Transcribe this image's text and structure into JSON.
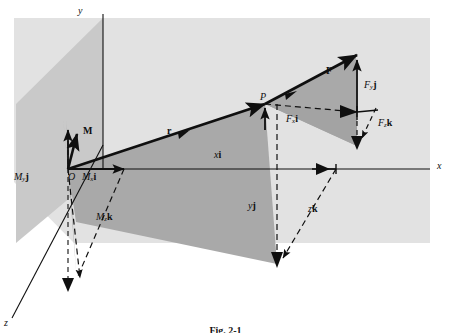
{
  "figure": {
    "caption": "Fig. 2-1",
    "background_color": "#ffffff",
    "panel_color": "#e2e2e2",
    "plane_shade_color": "#b9b9b9",
    "line_color": "#0f0f0f"
  },
  "axes": [
    {
      "name": "y-axis",
      "label": "y",
      "x": 78,
      "y": 6
    },
    {
      "name": "x-axis",
      "label": "x",
      "x": 437,
      "y": 167
    },
    {
      "name": "z-axis",
      "label": "z",
      "x": 4,
      "y": 320
    }
  ],
  "points": [
    {
      "name": "origin",
      "label": "O",
      "x": 68,
      "y": 177
    },
    {
      "name": "point-p",
      "label": "P",
      "x": 265,
      "y": 101
    }
  ],
  "vectors": [
    {
      "name": "force-vector",
      "label": "F",
      "x": 326,
      "y": 65
    },
    {
      "name": "position-vector",
      "label": "r",
      "x": 165,
      "y": 119
    },
    {
      "name": "moment-vector",
      "label": "M",
      "x": 82,
      "y": 120
    }
  ],
  "components": [
    {
      "name": "force-x-component",
      "base": "F",
      "sub": "x",
      "unit": "i",
      "x": 288,
      "y": 113
    },
    {
      "name": "force-y-component",
      "base": "F",
      "sub": "y",
      "unit": "j",
      "x": 365,
      "y": 85
    },
    {
      "name": "force-z-component",
      "base": "F",
      "sub": "z",
      "unit": "k",
      "x": 378,
      "y": 122
    },
    {
      "name": "moment-x-component",
      "base": "M",
      "sub": "x",
      "unit": "i",
      "x": 84,
      "y": 176
    },
    {
      "name": "moment-y-component",
      "base": "M",
      "sub": "y",
      "unit": "j",
      "x": 15,
      "y": 176
    },
    {
      "name": "moment-z-component",
      "base": "M",
      "sub": "z",
      "unit": "k",
      "x": 97,
      "y": 216
    },
    {
      "name": "position-x-component",
      "base": "",
      "sub": "",
      "unit": "",
      "x": 0,
      "y": 0
    }
  ],
  "position_components": [
    {
      "name": "position-x-component",
      "label_italic": "x",
      "label_bold": "i",
      "x": 216,
      "y": 154
    },
    {
      "name": "position-y-component",
      "label_italic": "y",
      "label_bold": "j",
      "x": 249,
      "y": 205
    },
    {
      "name": "position-z-component",
      "label_italic": "z",
      "label_bold": "k",
      "x": 309,
      "y": 208
    }
  ]
}
